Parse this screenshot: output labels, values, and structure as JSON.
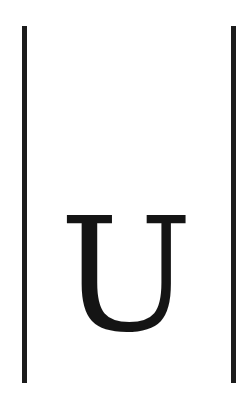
{
  "symbol": {
    "letter": "U",
    "left_bar": "|",
    "right_bar": "|"
  },
  "colors": {
    "background": "#ffffff",
    "ink": "#1c1c1c"
  }
}
